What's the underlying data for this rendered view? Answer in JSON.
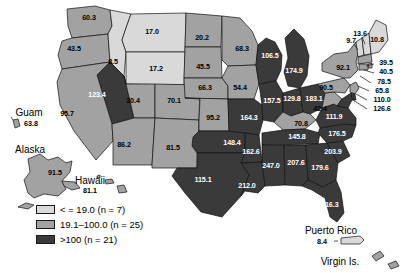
{
  "figure": {
    "title": "",
    "legend": {
      "items": [
        {
          "label": "< = 19.0 (n = 7)",
          "color": "#d9d9d9",
          "category": "low"
        },
        {
          "label": "19.1–100.0 (n = 25)",
          "color": "#a2a2a2",
          "category": "mid"
        },
        {
          "label": ">100 (n = 21)",
          "color": "#3a3a3a",
          "category": "high"
        }
      ]
    }
  },
  "chart_data": {
    "type": "map",
    "title": "",
    "value_unit": "rate",
    "categories": [
      "< = 19.0 (n = 7)",
      "19.1–100.0 (n = 25)",
      ">100 (n = 21)"
    ],
    "category_colors": [
      "#d9d9d9",
      "#a2a2a2",
      "#3a3a3a"
    ],
    "states": [
      {
        "code": "WA",
        "value": "60.3",
        "category": "mid",
        "x": 89,
        "y": 18
      },
      {
        "code": "OR",
        "value": "43.5",
        "category": "mid",
        "x": 74,
        "y": 49
      },
      {
        "code": "ID",
        "value": "8.5",
        "category": "low",
        "x": 113,
        "y": 62
      },
      {
        "code": "MT",
        "value": "17.0",
        "category": "low",
        "x": 152,
        "y": 32
      },
      {
        "code": "WY",
        "value": "17.2",
        "category": "low",
        "x": 156,
        "y": 69
      },
      {
        "code": "NV",
        "value": "123.4",
        "category": "high",
        "x": 97,
        "y": 95
      },
      {
        "code": "CA",
        "value": "95.7",
        "category": "mid",
        "x": 67,
        "y": 114
      },
      {
        "code": "UT",
        "value": "30.4",
        "category": "mid",
        "x": 133,
        "y": 101
      },
      {
        "code": "CO",
        "value": "70.1",
        "category": "mid",
        "x": 174,
        "y": 101
      },
      {
        "code": "AZ",
        "value": "86.2",
        "category": "mid",
        "x": 124,
        "y": 145
      },
      {
        "code": "NM",
        "value": "81.5",
        "category": "mid",
        "x": 173,
        "y": 148
      },
      {
        "code": "ND",
        "value": "20.2",
        "category": "mid",
        "x": 202,
        "y": 38
      },
      {
        "code": "SD",
        "value": "45.5",
        "category": "mid",
        "x": 203,
        "y": 67
      },
      {
        "code": "NE",
        "value": "66.3",
        "category": "mid",
        "x": 205,
        "y": 88
      },
      {
        "code": "KS",
        "value": "95.2",
        "category": "mid",
        "x": 213,
        "y": 118
      },
      {
        "code": "OK",
        "value": "148.4",
        "category": "high",
        "x": 232,
        "y": 143
      },
      {
        "code": "TX",
        "value": "115.1",
        "category": "high",
        "x": 203,
        "y": 180
      },
      {
        "code": "MN",
        "value": "68.3",
        "category": "mid",
        "x": 242,
        "y": 49
      },
      {
        "code": "IA",
        "value": "54.4",
        "category": "mid",
        "x": 240,
        "y": 88
      },
      {
        "code": "MO",
        "value": "164.3",
        "category": "high",
        "x": 249,
        "y": 118
      },
      {
        "code": "AR",
        "value": "162.6",
        "category": "high",
        "x": 251,
        "y": 152
      },
      {
        "code": "LA",
        "value": "212.0",
        "category": "high",
        "x": 247,
        "y": 186
      },
      {
        "code": "WI",
        "value": "106.5",
        "category": "high",
        "x": 270,
        "y": 56
      },
      {
        "code": "IL",
        "value": "157.5",
        "category": "high",
        "x": 272,
        "y": 101
      },
      {
        "code": "MI",
        "value": "174.9",
        "category": "high",
        "x": 294,
        "y": 71
      },
      {
        "code": "IN",
        "value": "129.8",
        "category": "high",
        "x": 292,
        "y": 99
      },
      {
        "code": "OH",
        "value": "183.1",
        "category": "high",
        "x": 314,
        "y": 99
      },
      {
        "code": "KY",
        "value": "70.8",
        "category": "mid",
        "x": 301,
        "y": 124
      },
      {
        "code": "TN",
        "value": "145.8",
        "category": "high",
        "x": 297,
        "y": 137
      },
      {
        "code": "MS",
        "value": "247.0",
        "category": "high",
        "x": 271,
        "y": 166
      },
      {
        "code": "AL",
        "value": "207.6",
        "category": "high",
        "x": 296,
        "y": 163
      },
      {
        "code": "GA",
        "value": "179.6",
        "category": "high",
        "x": 320,
        "y": 168
      },
      {
        "code": "SC",
        "value": "203.9",
        "category": "high",
        "x": 333,
        "y": 152
      },
      {
        "code": "NC",
        "value": "176.5",
        "category": "high",
        "x": 337,
        "y": 134
      },
      {
        "code": "VA",
        "value": "111.9",
        "category": "high",
        "x": 334,
        "y": 117
      },
      {
        "code": "WV",
        "value": "42.4",
        "category": "mid",
        "x": 320,
        "y": 109
      },
      {
        "code": "FL",
        "value": "116.3",
        "category": "high",
        "x": 330,
        "y": 205
      },
      {
        "code": "PA",
        "value": "90.5",
        "category": "mid",
        "x": 326,
        "y": 88
      },
      {
        "code": "NY",
        "value": "92.1",
        "category": "mid",
        "x": 343,
        "y": 68
      },
      {
        "code": "VT",
        "value": "9.7",
        "category": "low",
        "x": 351,
        "y": 41
      },
      {
        "code": "NH",
        "value": "13.6",
        "category": "low",
        "x": 360,
        "y": 34
      },
      {
        "code": "ME",
        "value": "10.8",
        "category": "low",
        "x": 377,
        "y": 40
      }
    ],
    "callouts": [
      {
        "code": "MA",
        "value": "39.5",
        "label_x": 386,
        "label_y": 63,
        "line": "M 374,64 L 366,66"
      },
      {
        "code": "RI",
        "value": "40.5",
        "label_x": 386,
        "label_y": 72,
        "line": "M 374,73 L 364,70"
      },
      {
        "code": "CT",
        "value": "78.5",
        "label_x": 384,
        "label_y": 82,
        "line": "M 371,83 L 360,76"
      },
      {
        "code": "NJ",
        "value": "65.8",
        "label_x": 382,
        "label_y": 91,
        "line": "M 369,91 L 358,86"
      },
      {
        "code": "DE",
        "value": "110.0",
        "label_x": 382,
        "label_y": 100,
        "line": "M 367,100 L 356,94"
      },
      {
        "code": "MD",
        "value": "126.6",
        "label_x": 382,
        "label_y": 109,
        "line": "M 367,109 L 353,100"
      }
    ],
    "territories": [
      {
        "name": "Guam",
        "value": "63.8",
        "name_x": 29,
        "name_y": 113,
        "val_x": 31,
        "val_y": 124
      },
      {
        "name": "Alaska",
        "value": "91.5",
        "name_x": 30,
        "name_y": 150,
        "val_x": 55,
        "val_y": 173
      },
      {
        "name": "Hawaii",
        "value": "81.1",
        "name_x": 90,
        "name_y": 181,
        "val_x": 90,
        "val_y": 191
      },
      {
        "name": "Puerto Rico",
        "value": "8.4",
        "name_x": 331,
        "name_y": 231,
        "val_x": 322,
        "val_y": 242
      },
      {
        "name": "Virgin Is.",
        "value": "",
        "name_x": 340,
        "name_y": 262,
        "val_x": 0,
        "val_y": 0
      }
    ]
  }
}
